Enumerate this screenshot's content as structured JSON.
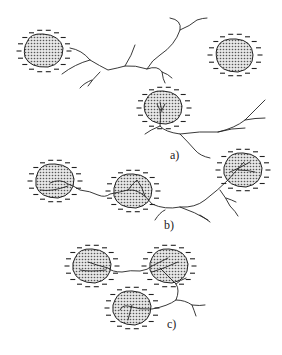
{
  "figure": {
    "panels": [
      {
        "id": "a",
        "label": "a)",
        "label_pos": [
          170,
          148
        ]
      },
      {
        "id": "b",
        "label": "b)",
        "label_pos": [
          164,
          218
        ]
      },
      {
        "id": "c",
        "label": "c)",
        "label_pos": [
          167,
          317
        ]
      }
    ],
    "legend": {
      "particle": "dotted-shaded particle surrounded by negative charges (–)",
      "channel": "branched discharge channel (tree)"
    },
    "colors": {
      "ink": "#222222",
      "fill_dots": "#555555",
      "background": "#ffffff"
    }
  }
}
